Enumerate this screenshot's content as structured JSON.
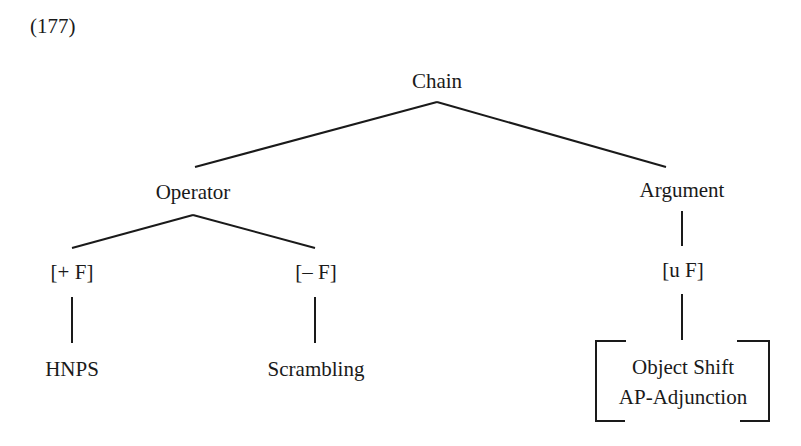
{
  "example_number": "(177)",
  "tree": {
    "root": "Chain",
    "operator": {
      "label": "Operator",
      "plus_f": "[+ F]",
      "minus_f": "[– F]",
      "plus_f_leaf": "HNPS",
      "minus_f_leaf": "Scrambling"
    },
    "argument": {
      "label": "Argument",
      "u_f": "[u F]",
      "leaves": [
        "Object Shift",
        "AP-Adjunction"
      ]
    }
  },
  "colors": {
    "line": "#1a1a1a",
    "background": "#ffffff"
  }
}
